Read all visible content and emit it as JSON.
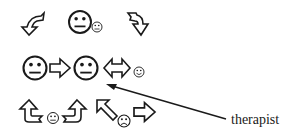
{
  "diagram": {
    "rows": [
      {
        "row": 1,
        "elements": [
          {
            "icon": "curved-arrow-down-left-icon"
          },
          {
            "icon": "neutral-face-icon",
            "size": "large"
          },
          {
            "icon": "neutral-face-icon",
            "size": "small"
          },
          {
            "icon": "curved-arrow-down-right-icon"
          }
        ]
      },
      {
        "row": 2,
        "elements": [
          {
            "icon": "neutral-face-icon",
            "size": "large"
          },
          {
            "icon": "right-arrow-icon"
          },
          {
            "icon": "neutral-face-icon",
            "size": "large"
          },
          {
            "icon": "left-right-arrow-icon"
          },
          {
            "icon": "smiling-face-icon",
            "size": "small"
          }
        ]
      },
      {
        "row": 3,
        "elements": [
          {
            "icon": "curly-arrow-up-left-icon"
          },
          {
            "icon": "neutral-face-icon",
            "size": "small"
          },
          {
            "icon": "curly-arrow-up-right-icon"
          },
          {
            "icon": "diagonal-arrow-up-left-icon"
          },
          {
            "icon": "frowning-face-icon",
            "size": "small"
          },
          {
            "icon": "right-arrow-icon"
          }
        ]
      }
    ],
    "annotation": {
      "label": "therapist",
      "points_to": "second large neutral face in row 2"
    },
    "stroke_color": "#1a1a1a",
    "background_color": "#ffffff"
  }
}
